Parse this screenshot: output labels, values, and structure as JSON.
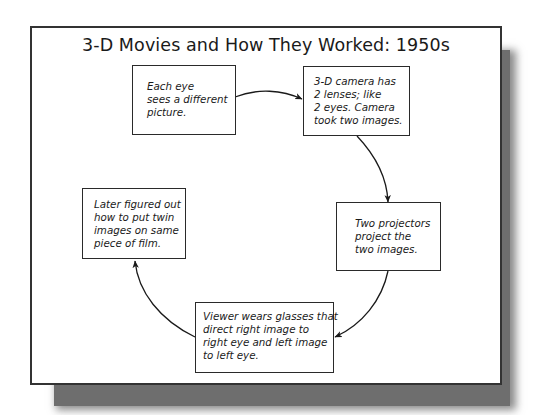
{
  "diagram": {
    "title": "3-D Movies and How They Worked: 1950s",
    "type": "cycle",
    "nodes": [
      {
        "id": "eye",
        "lines": [
          "Each eye",
          "sees a different",
          "picture."
        ]
      },
      {
        "id": "camera",
        "lines": [
          "3-D camera has",
          "2 lenses; like",
          "2 eyes.  Camera",
          "took two images."
        ]
      },
      {
        "id": "projectors",
        "lines": [
          "Two projectors",
          "project the",
          "two images."
        ]
      },
      {
        "id": "glasses",
        "lines": [
          "Viewer wears glasses that",
          "direct right image to",
          "right eye and left image",
          "to left eye."
        ]
      },
      {
        "id": "film",
        "lines": [
          "Later figured out",
          "how to put twin",
          "images on same",
          "piece of film."
        ]
      }
    ],
    "edges": [
      {
        "from": "eye",
        "to": "camera"
      },
      {
        "from": "camera",
        "to": "projectors"
      },
      {
        "from": "projectors",
        "to": "glasses"
      },
      {
        "from": "glasses",
        "to": "film"
      }
    ],
    "colors": {
      "border": "#2a2a2a",
      "shadow": "#6e6e6e",
      "background": "#ffffff",
      "text": "#1a1a1a"
    }
  }
}
